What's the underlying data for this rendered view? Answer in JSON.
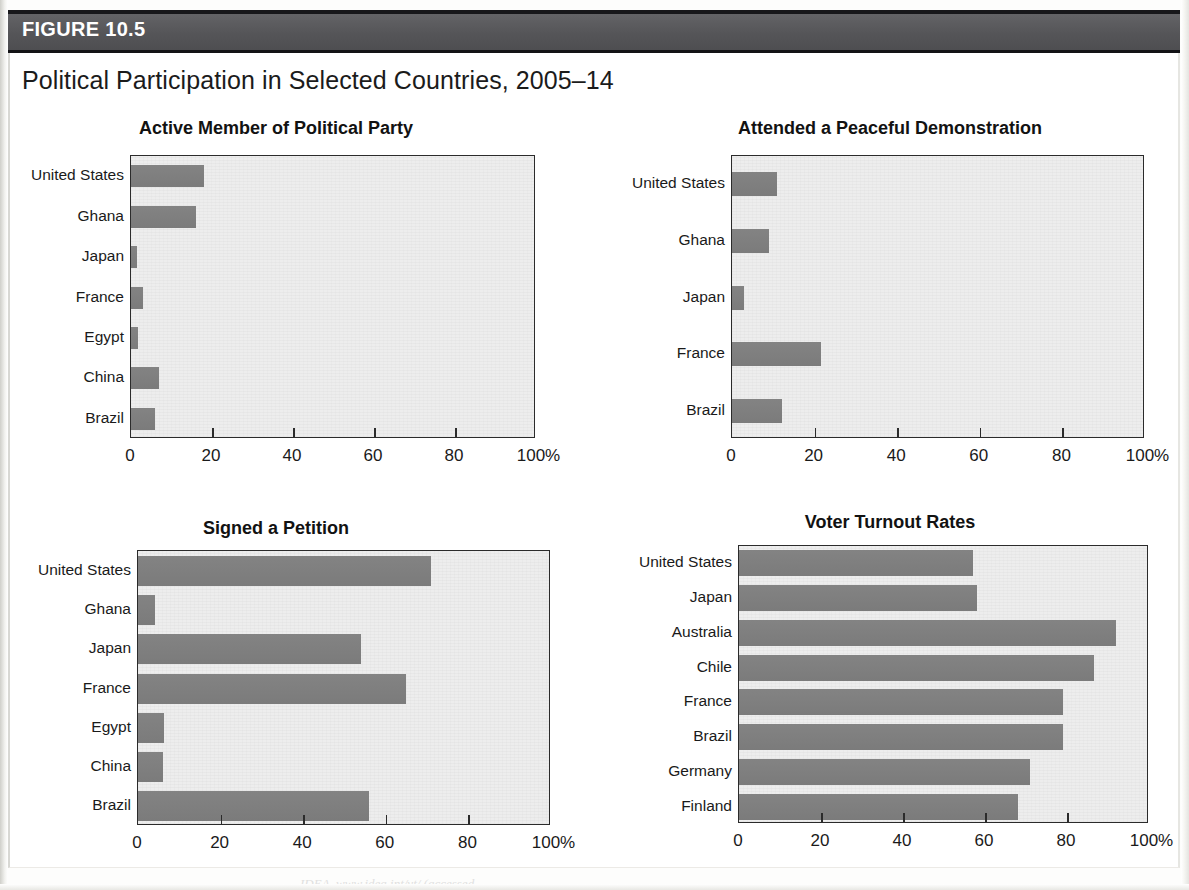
{
  "figure": {
    "label": "FIGURE 10.5",
    "title": "Political Participation in Selected Countries, 2005–14",
    "source_fragment": "IDEA, www.idea.int/vt/ (accessed"
  },
  "axis": {
    "ticks": [
      "0",
      "20",
      "40",
      "60",
      "80",
      "100%"
    ],
    "tick_values": [
      0,
      20,
      40,
      60,
      80,
      100
    ]
  },
  "colors": {
    "bar": "#7f7f7f",
    "plot_background": "#ededed",
    "header_band": "#5b5b5e",
    "axis": "#2b2b2b",
    "text": "#1a1a1a"
  },
  "chart_data": [
    {
      "type": "bar",
      "orientation": "horizontal",
      "title": "Active Member of Political Party",
      "xlabel": "",
      "ylabel": "",
      "xlim": [
        0,
        100
      ],
      "grid": false,
      "legend": "none",
      "categories": [
        "United States",
        "Ghana",
        "Japan",
        "France",
        "Egypt",
        "China",
        "Brazil"
      ],
      "values": [
        18,
        16,
        1.5,
        3,
        1.7,
        7,
        6
      ],
      "tick_labels": [
        "0",
        "20",
        "40",
        "60",
        "80",
        "100%"
      ]
    },
    {
      "type": "bar",
      "orientation": "horizontal",
      "title": "Attended a Peaceful Demonstration",
      "xlabel": "",
      "ylabel": "",
      "xlim": [
        0,
        100
      ],
      "grid": false,
      "legend": "none",
      "categories": [
        "United States",
        "Ghana",
        "Japan",
        "France",
        "Brazil"
      ],
      "values": [
        11,
        9,
        3,
        21.5,
        12
      ],
      "tick_labels": [
        "0",
        "20",
        "40",
        "60",
        "80",
        "100%"
      ]
    },
    {
      "type": "bar",
      "orientation": "horizontal",
      "title": "Signed a Petition",
      "xlabel": "",
      "ylabel": "",
      "xlim": [
        0,
        100
      ],
      "grid": false,
      "legend": "none",
      "categories": [
        "United States",
        "Ghana",
        "Japan",
        "France",
        "Egypt",
        "China",
        "Brazil"
      ],
      "values": [
        71,
        4,
        54,
        65,
        6.3,
        6,
        56
      ],
      "tick_labels": [
        "0",
        "20",
        "40",
        "60",
        "80",
        "100%"
      ]
    },
    {
      "type": "bar",
      "orientation": "horizontal",
      "title": "Voter Turnout Rates",
      "xlabel": "",
      "ylabel": "",
      "xlim": [
        0,
        100
      ],
      "grid": false,
      "legend": "none",
      "categories": [
        "United States",
        "Japan",
        "Australia",
        "Chile",
        "France",
        "Brazil",
        "Germany",
        "Finland"
      ],
      "values": [
        57,
        58,
        92,
        86.5,
        79,
        79,
        71,
        68
      ],
      "tick_labels": [
        "0",
        "20",
        "40",
        "60",
        "80",
        "100%"
      ]
    }
  ]
}
